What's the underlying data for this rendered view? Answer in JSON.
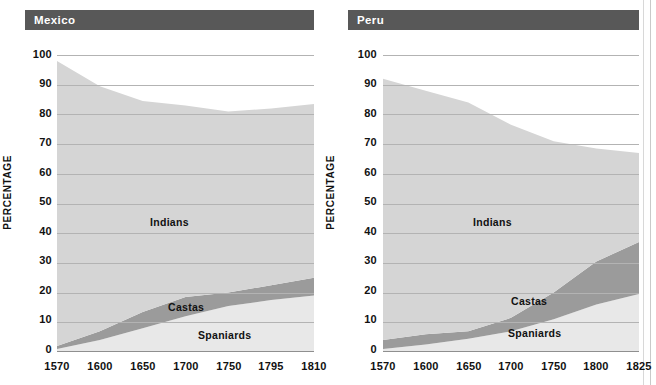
{
  "chart_data": [
    {
      "type": "area",
      "title": "Mexico",
      "stacked": true,
      "xlabel": "",
      "ylabel": "PERCENTAGE",
      "ylim": [
        0,
        100
      ],
      "yticks": [
        0,
        10,
        20,
        30,
        40,
        50,
        60,
        70,
        80,
        90,
        100
      ],
      "x": [
        1570,
        1600,
        1650,
        1700,
        1750,
        1795,
        1810
      ],
      "xtick_labels": [
        "1570",
        "1600",
        "1650",
        "1700",
        "1750",
        "1795",
        "1810"
      ],
      "grid": true,
      "legend": "inline-labels",
      "series": [
        {
          "name": "Spaniards",
          "values": [
            1.0,
            4.0,
            8.0,
            12.0,
            15.5,
            17.5,
            19.0
          ],
          "color": "#e8e8e8"
        },
        {
          "name": "Castas",
          "values": [
            1.0,
            3.0,
            5.5,
            6.5,
            4.5,
            5.0,
            6.0
          ],
          "color": "#9b9b9b"
        },
        {
          "name": "Indians",
          "values": [
            96.0,
            82.5,
            71.0,
            64.5,
            61.0,
            59.5,
            58.5
          ],
          "color": "#d5d5d5"
        }
      ],
      "cumulative_tops": {
        "spaniards": [
          1.0,
          4.0,
          8.0,
          12.0,
          15.5,
          17.5,
          19.0
        ],
        "castas": [
          2.0,
          7.0,
          13.5,
          18.5,
          20.0,
          22.5,
          25.0
        ],
        "indians": [
          98.0,
          89.5,
          84.5,
          83.0,
          81.0,
          82.0,
          83.5
        ]
      },
      "band_labels": [
        "Indians",
        "Castas",
        "Spaniards"
      ]
    },
    {
      "type": "area",
      "title": "Peru",
      "stacked": true,
      "xlabel": "",
      "ylabel": "PERCENTAGE",
      "ylim": [
        0,
        100
      ],
      "yticks": [
        0,
        10,
        20,
        30,
        40,
        50,
        60,
        70,
        80,
        90,
        100
      ],
      "x": [
        1570,
        1600,
        1650,
        1700,
        1750,
        1800,
        1825
      ],
      "xtick_labels": [
        "1570",
        "1600",
        "1650",
        "1700",
        "1750",
        "1800",
        "1825"
      ],
      "grid": true,
      "legend": "inline-labels",
      "series": [
        {
          "name": "Spaniards",
          "values": [
            1.0,
            2.5,
            4.5,
            7.0,
            11.0,
            16.0,
            19.5
          ],
          "color": "#e8e8e8"
        },
        {
          "name": "Castas",
          "values": [
            3.0,
            3.5,
            2.5,
            4.5,
            9.0,
            14.5,
            17.5
          ],
          "color": "#9b9b9b"
        },
        {
          "name": "Indians",
          "values": [
            88.0,
            82.0,
            77.0,
            65.0,
            51.0,
            38.0,
            30.0
          ],
          "color": "#d5d5d5"
        }
      ],
      "cumulative_tops": {
        "spaniards": [
          1.0,
          2.5,
          4.5,
          7.0,
          11.0,
          16.0,
          19.5
        ],
        "castas": [
          4.0,
          6.0,
          7.0,
          11.5,
          20.0,
          30.5,
          37.0
        ],
        "indians": [
          92.0,
          88.0,
          84.0,
          76.5,
          71.0,
          68.5,
          67.0
        ]
      },
      "band_labels": [
        "Indians",
        "Castas",
        "Spaniards"
      ]
    }
  ],
  "panels": [
    {
      "title": "Mexico",
      "ylabel": "PERCENTAGE",
      "yticks": [
        "100",
        "90",
        "80",
        "70",
        "60",
        "50",
        "40",
        "30",
        "20",
        "10",
        "0"
      ],
      "xticks": [
        "1570",
        "1600",
        "1650",
        "1700",
        "1750",
        "1795",
        "1810"
      ],
      "labels": {
        "indians": "Indians",
        "castas": "Castas",
        "spaniards": "Spaniards"
      }
    },
    {
      "title": "Peru",
      "ylabel": "PERCENTAGE",
      "yticks": [
        "100",
        "90",
        "80",
        "70",
        "60",
        "50",
        "40",
        "30",
        "20",
        "10",
        "0"
      ],
      "xticks": [
        "1570",
        "1600",
        "1650",
        "1700",
        "1750",
        "1800",
        "1825"
      ],
      "labels": {
        "indians": "Indians",
        "castas": "Castas",
        "spaniards": "Spaniards"
      }
    }
  ],
  "colors": {
    "title_bar": "#585858",
    "indians": "#d5d5d5",
    "castas": "#9b9b9b",
    "spaniards": "#e8e8e8",
    "gridline": "#b3b3b3",
    "text": "#111111",
    "background": "#ffffff"
  }
}
